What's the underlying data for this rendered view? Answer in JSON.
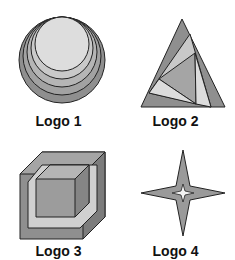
{
  "figure": {
    "logos": [
      {
        "id": 1,
        "label": "Logo 1",
        "shape": "nested-circles-icon"
      },
      {
        "id": 2,
        "label": "Logo 2",
        "shape": "nested-triangles-icon"
      },
      {
        "id": 3,
        "label": "Logo 3",
        "shape": "nested-cubes-icon"
      },
      {
        "id": 4,
        "label": "Logo 4",
        "shape": "four-point-star-icon"
      }
    ],
    "colors": {
      "dark": "#8a8a8a",
      "mid": "#a5a5a5",
      "light": "#c6c6c6",
      "lighter": "#dcdcdc",
      "stroke": "#222222"
    }
  }
}
